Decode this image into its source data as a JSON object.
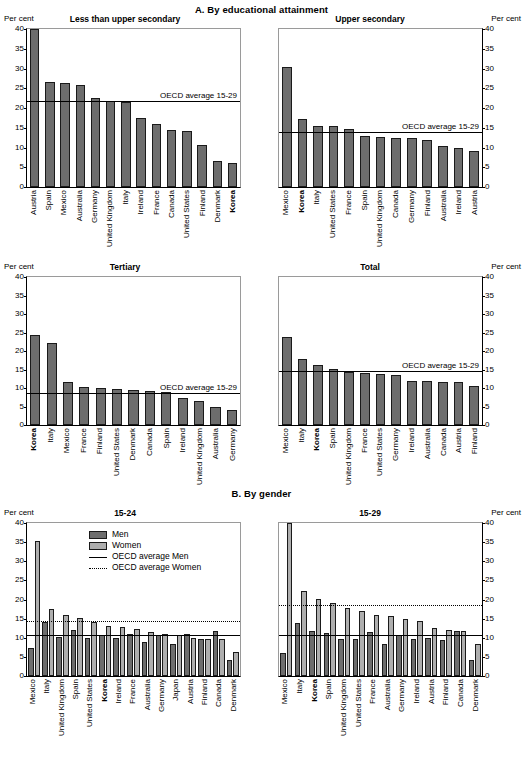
{
  "sections": {
    "a_title": "A. By educational attainment",
    "b_title": "B. By gender"
  },
  "unit": "Per cent",
  "avg_label": "OECD average 15-29",
  "legend": {
    "men": "Men",
    "women": "Women",
    "avg_men": "OECD average Men",
    "avg_women": "OECD average Women"
  },
  "colors": {
    "men": "#6d6d6d",
    "women": "#aeaeae",
    "axis": "#000000"
  },
  "yticks": [
    "40",
    "35",
    "30",
    "25",
    "20",
    "15",
    "10",
    "5",
    "0"
  ],
  "chart_data": [
    {
      "id": "less-than-upper-secondary",
      "type": "bar",
      "title": "Less than upper secondary",
      "ylabel": "Per cent",
      "ylim": [
        0,
        40
      ],
      "yticks": [
        0,
        5,
        10,
        15,
        20,
        25,
        30,
        35,
        40
      ],
      "grid": false,
      "legend_position": "none",
      "annotations": [
        {
          "text": "OECD average 15-29",
          "value": 21.6
        }
      ],
      "reference_lines": [
        {
          "name": "OECD average 15-29",
          "value": 21.6,
          "style": "solid"
        }
      ],
      "categories": [
        "Austria",
        "Spain",
        "Mexico",
        "Australia",
        "Germany",
        "United Kingdom",
        "Italy",
        "Ireland",
        "France",
        "Canada",
        "United States",
        "Finland",
        "Denmark",
        "Korea"
      ],
      "highlight": [
        "Korea"
      ],
      "values": [
        40.0,
        26.5,
        26.3,
        25.9,
        22.6,
        21.8,
        21.4,
        17.5,
        15.9,
        14.4,
        14.2,
        10.7,
        6.7,
        6.2
      ]
    },
    {
      "id": "upper-secondary",
      "type": "bar",
      "title": "Upper secondary",
      "ylabel": "Per cent",
      "ylim": [
        0,
        40
      ],
      "yticks": [
        0,
        5,
        10,
        15,
        20,
        25,
        30,
        35,
        40
      ],
      "grid": false,
      "legend_position": "none",
      "annotations": [
        {
          "text": "OECD average 15-29",
          "value": 13.7
        }
      ],
      "reference_lines": [
        {
          "name": "OECD average 15-29",
          "value": 13.7,
          "style": "solid"
        }
      ],
      "categories": [
        "Mexico",
        "Korea",
        "Italy",
        "United States",
        "France",
        "Spain",
        "United Kingdom",
        "Canada",
        "Germany",
        "Finland",
        "Australia",
        "Ireland",
        "Austria"
      ],
      "highlight": [
        "Korea"
      ],
      "values": [
        30.3,
        17.1,
        15.5,
        15.4,
        14.8,
        12.8,
        12.6,
        12.4,
        12.3,
        11.9,
        10.3,
        9.8,
        9.2
      ]
    },
    {
      "id": "tertiary",
      "type": "bar",
      "title": "Tertiary",
      "ylabel": "Per cent",
      "ylim": [
        0,
        40
      ],
      "yticks": [
        0,
        5,
        10,
        15,
        20,
        25,
        30,
        35,
        40
      ],
      "grid": false,
      "legend_position": "none",
      "annotations": [
        {
          "text": "OECD average 15-29",
          "value": 8.3
        }
      ],
      "reference_lines": [
        {
          "name": "OECD average 15-29",
          "value": 8.3,
          "style": "solid"
        }
      ],
      "categories": [
        "Korea",
        "Italy",
        "Mexico",
        "France",
        "Finland",
        "United States",
        "Denmark",
        "Canada",
        "Spain",
        "Ireland",
        "United Kingdom",
        "Australia",
        "Germany"
      ],
      "highlight": [
        "Korea"
      ],
      "values": [
        24.4,
        22.3,
        11.7,
        10.4,
        9.9,
        9.7,
        9.5,
        9.1,
        8.9,
        7.3,
        6.6,
        5.0,
        4.1
      ]
    },
    {
      "id": "total",
      "type": "bar",
      "title": "Total",
      "ylabel": "Per cent",
      "ylim": [
        0,
        40
      ],
      "yticks": [
        0,
        5,
        10,
        15,
        20,
        25,
        30,
        35,
        40
      ],
      "grid": false,
      "legend_position": "none",
      "annotations": [
        {
          "text": "OECD average 15-29",
          "value": 14.4
        }
      ],
      "reference_lines": [
        {
          "name": "OECD average 15-29",
          "value": 14.4,
          "style": "solid"
        }
      ],
      "categories": [
        "Mexico",
        "Italy",
        "Korea",
        "Spain",
        "United Kingdom",
        "France",
        "United States",
        "Germany",
        "Ireland",
        "Australia",
        "Canada",
        "Austria",
        "Finland"
      ],
      "highlight": [
        "Korea"
      ],
      "values": [
        23.8,
        17.9,
        16.2,
        15.2,
        14.3,
        14.1,
        13.8,
        13.4,
        11.8,
        11.9,
        11.7,
        11.5,
        10.6
      ]
    },
    {
      "id": "by-gender-15-24",
      "type": "bar",
      "title": "15-24",
      "ylabel": "Per cent",
      "ylim": [
        0,
        40
      ],
      "yticks": [
        0,
        5,
        10,
        15,
        20,
        25,
        30,
        35,
        40
      ],
      "grid": false,
      "legend_position": "top-center",
      "reference_lines": [
        {
          "name": "OECD average Men",
          "value": 10.4,
          "style": "solid"
        },
        {
          "name": "OECD average Women",
          "value": 14.1,
          "style": "dotted"
        }
      ],
      "categories": [
        "Mexico",
        "Italy",
        "United Kingdom",
        "Spain",
        "United States",
        "Korea",
        "Ireland",
        "France",
        "Australia",
        "Germany",
        "Japan",
        "Austria",
        "Finland",
        "Canada",
        "Denmark"
      ],
      "highlight": [
        "Korea"
      ],
      "series": [
        {
          "name": "Men",
          "values": [
            7.2,
            14.0,
            10.2,
            11.9,
            9.9,
            10.6,
            10.0,
            11.1,
            8.9,
            10.7,
            8.4,
            11.0,
            9.8,
            11.8,
            4.2
          ]
        },
        {
          "name": "Women",
          "values": [
            35.4,
            17.5,
            15.9,
            15.2,
            14.1,
            13.2,
            12.7,
            12.2,
            11.5,
            11.0,
            10.7,
            10.0,
            9.7,
            9.7,
            6.3
          ]
        }
      ]
    },
    {
      "id": "by-gender-15-29",
      "type": "bar",
      "title": "15-29",
      "ylabel": "Per cent",
      "ylim": [
        0,
        40
      ],
      "yticks": [
        0,
        5,
        10,
        15,
        20,
        25,
        30,
        35,
        40
      ],
      "grid": false,
      "legend_position": "none",
      "reference_lines": [
        {
          "name": "OECD average Men",
          "value": 10.4,
          "style": "solid"
        },
        {
          "name": "OECD average Women",
          "value": 18.2,
          "style": "dotted"
        }
      ],
      "categories": [
        "Mexico",
        "Italy",
        "Korea",
        "Spain",
        "United Kingdom",
        "United States",
        "France",
        "Australia",
        "Germany",
        "Ireland",
        "Austria",
        "Finland",
        "Canada",
        "Denmark"
      ],
      "highlight": [
        "Korea"
      ],
      "series": [
        {
          "name": "Men",
          "values": [
            6.1,
            13.9,
            11.8,
            11.2,
            9.8,
            9.6,
            11.4,
            8.3,
            10.8,
            9.6,
            10.0,
            9.3,
            11.7,
            4.3
          ]
        },
        {
          "name": "Women",
          "values": [
            39.9,
            22.1,
            20.1,
            19.0,
            17.7,
            17.1,
            16.0,
            15.8,
            15.0,
            14.3,
            12.5,
            12.0,
            11.7,
            8.5
          ]
        }
      ]
    }
  ]
}
